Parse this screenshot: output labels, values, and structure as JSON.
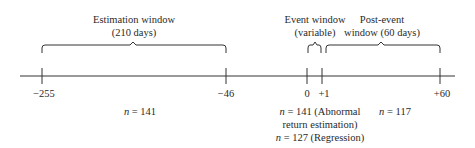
{
  "diagram": {
    "type": "event-study timeline",
    "windows": [
      {
        "id": "estimation",
        "title": "Estimation window",
        "subtitle": "(210 days)"
      },
      {
        "id": "event",
        "title": "Event window",
        "subtitle": "(variable)"
      },
      {
        "id": "post_event",
        "title": "Post-event",
        "subtitle": "window (60 days)"
      }
    ],
    "ticks": [
      {
        "label": "−255",
        "x": 42
      },
      {
        "label": "−46",
        "x": 226
      },
      {
        "label": "0",
        "x": 307
      },
      {
        "label": "+1",
        "x": 322
      },
      {
        "label": "+60",
        "x": 440
      }
    ],
    "counts": {
      "estimation": {
        "n_label": "n",
        "text": " = 141"
      },
      "event_line1": {
        "n_label": "n",
        "text": " = 141 (Abnormal"
      },
      "event_line2": {
        "text": "return estimation)"
      },
      "event_line3": {
        "n_label": "n",
        "text": " = 127 (Regression)"
      },
      "post_event": {
        "n_label": "n",
        "text": " = 117"
      }
    }
  }
}
